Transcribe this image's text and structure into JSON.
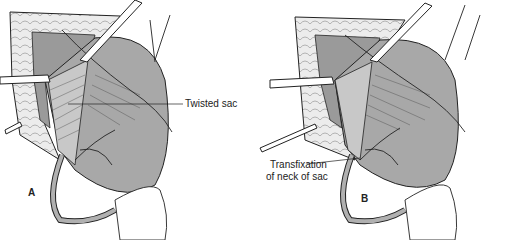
{
  "figure": {
    "panels": [
      {
        "id": "A",
        "letter": "A",
        "callout": "Twisted sac"
      },
      {
        "id": "B",
        "letter": "B",
        "callout_line1": "Transfixation",
        "callout_line2": "of neck of sac"
      }
    ],
    "colors": {
      "sac_fill": "#a8a8a8",
      "skin_fill": "#e8e8e8",
      "line": "#222222"
    }
  }
}
